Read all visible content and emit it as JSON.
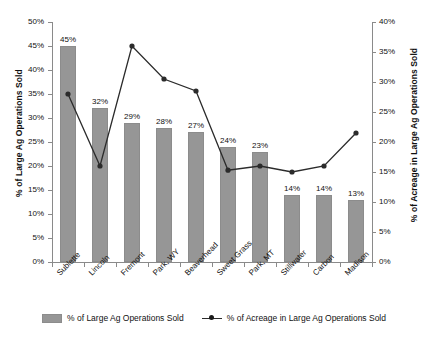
{
  "chart_data": {
    "type": "bar",
    "title": "",
    "subtitle": "",
    "xlabel": "",
    "ylabel": "% of Large Ag Operations Sold",
    "y2label": "% of Acreage in Large Ag Operations Sold",
    "ylim": [
      0,
      50
    ],
    "y2lim": [
      0,
      40
    ],
    "grid": false,
    "legend_position": "bottom",
    "categories": [
      "Sublette",
      "Lincoln",
      "Fremont",
      "Park, WY",
      "Beaverhead",
      "Sweet Grass",
      "Park, MT",
      "Stillwater",
      "Carbon",
      "Madison"
    ],
    "y_ticks": [
      "0%",
      "5%",
      "10%",
      "15%",
      "20%",
      "25%",
      "30%",
      "35%",
      "40%",
      "45%",
      "50%"
    ],
    "y_tick_values": [
      0,
      5,
      10,
      15,
      20,
      25,
      30,
      35,
      40,
      45,
      50
    ],
    "y2_ticks": [
      "0%",
      "5%",
      "10%",
      "15%",
      "20%",
      "25%",
      "30%",
      "35%",
      "40%"
    ],
    "y2_tick_values": [
      0,
      5,
      10,
      15,
      20,
      25,
      30,
      35,
      40
    ],
    "series": [
      {
        "name": "% of Large Ag Operations Sold",
        "type": "bar",
        "axis": "left",
        "color": "#969696",
        "values": [
          45,
          32,
          29,
          28,
          27,
          24,
          23,
          14,
          14,
          13
        ],
        "data_labels": [
          "45%",
          "32%",
          "29%",
          "28%",
          "27%",
          "24%",
          "23%",
          "14%",
          "14%",
          "13%"
        ]
      },
      {
        "name": "% of Acreage in Large Ag Operations Sold",
        "type": "line",
        "axis": "right",
        "color": "#2b2b2b",
        "marker": "diamond",
        "values": [
          28.0,
          16.0,
          36.0,
          30.5,
          28.5,
          15.3,
          16.0,
          15.0,
          16.0,
          21.5
        ]
      }
    ],
    "legend": [
      {
        "label": "% of Large Ag Operations Sold",
        "marker": "bar-swatch",
        "color": "#969696"
      },
      {
        "label": "% of Acreage in Large Ag Operations Sold",
        "marker": "line-marker",
        "color": "#2b2b2b"
      }
    ]
  }
}
